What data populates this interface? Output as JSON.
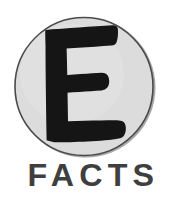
{
  "logo": {
    "brand_name": "E FACTS",
    "emblem": {
      "letter": "E",
      "letter_color": "#151515",
      "disc_fill": "#dcdcdc",
      "disc_outline": "#4a4a4a",
      "disc_shadow": "#a8a8a8",
      "icon_name": "letter-e-in-circle"
    },
    "wordmark": {
      "text": "FACTS",
      "color": "#3f3f3f"
    },
    "background_color": "#ffffff"
  }
}
